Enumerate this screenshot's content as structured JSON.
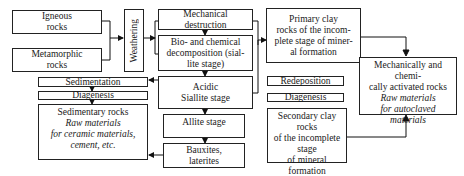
{
  "diagram": {
    "nodes": {
      "igneous": "Igneous rocks",
      "igneous_l1": "Igneous",
      "igneous_l2": "rocks",
      "metamorphic_l1": "Metamorphic",
      "metamorphic_l2": "rocks",
      "weathering": "Weathering",
      "mechanical_l1": "Mechanical",
      "mechanical_l2": "destruction",
      "biochem_l1": "Bio- and chemical",
      "biochem_l2": "decomposition (sial-",
      "biochem_l3": "lite stage)",
      "acidic_l1": "Acidic",
      "acidic_l2": "Siallite stage",
      "allite": "Allite stage",
      "bauxites_l1": "Bauxites,",
      "bauxites_l2": "laterites",
      "sedimentation": "Sedimentation",
      "diagenesis_left": "Diagenesis",
      "sedimentary_title": "Sedimentary rocks",
      "sedimentary_l1": "Raw materials",
      "sedimentary_l2": "for ceramic materials,",
      "sedimentary_l3": "cement, etc.",
      "primary_l1": "Primary clay",
      "primary_l2": "rocks of the incom-",
      "primary_l3": "plete stage of miner-",
      "primary_l4": "al formation",
      "redeposition": "Redeposition",
      "diagenesis_right": "Diagenesis",
      "secondary_l1": "Secondary clay rocks",
      "secondary_l2": "of the incomplete",
      "secondary_l3": "stage",
      "secondary_l4": "of mineral formation",
      "activated_l1": "Mechanically and chemi-",
      "activated_l2": "cally activated rocks",
      "activated_l3": "Raw materials",
      "activated_l4": "for autoclaved",
      "activated_l5": "materials"
    }
  }
}
